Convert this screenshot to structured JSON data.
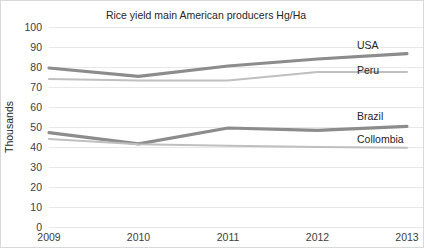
{
  "chart_data": {
    "type": "line",
    "title": "Rice yield main American producers Hg/Ha",
    "xlabel": "",
    "ylabel": "Thousands",
    "categories": [
      "2009",
      "2010",
      "2011",
      "2012",
      "2013"
    ],
    "x": [
      2009,
      2010,
      2011,
      2012,
      2013
    ],
    "ylim": [
      0,
      100
    ],
    "ytick_step": 10,
    "yticks": [
      "100",
      "90",
      "80",
      "70",
      "60",
      "50",
      "40",
      "30",
      "20",
      "10",
      "0"
    ],
    "grid": true,
    "legend_position": "right-inline-labels",
    "series": [
      {
        "name": "USA",
        "values": [
          79.5,
          75.3,
          80.5,
          84.0,
          86.7
        ],
        "color": "#8c8c8c",
        "label": "USA"
      },
      {
        "name": "Peru",
        "values": [
          74.0,
          73.2,
          73.2,
          77.5,
          77.5
        ],
        "color": "#bfbfbf",
        "label": "Peru"
      },
      {
        "name": "Brazil",
        "values": [
          47.2,
          41.6,
          49.5,
          48.3,
          50.3
        ],
        "color": "#8c8c8c",
        "label": "Brazil"
      },
      {
        "name": "Collombia",
        "values": [
          44.0,
          41.4,
          40.6,
          40.0,
          39.6
        ],
        "color": "#bfbfbf",
        "label": "Collombia"
      }
    ],
    "colors": {
      "dark_series": "#8c8c8c",
      "light_series": "#bfbfbf",
      "gridline": "#e8e8e8",
      "text": "#262626",
      "border": "#d9d9d9",
      "background": "#ffffff"
    }
  },
  "plot_geometry": {
    "plot_left": 48,
    "plot_right": 406,
    "plot_top": 26,
    "plot_bottom": 226,
    "title_x": 205,
    "title_y": 18,
    "ylabel_x": 12,
    "ylabel_y": 126,
    "xtick_y": 240,
    "series_label_x": 356,
    "series_label_y": [
      48,
      73,
      119,
      142
    ],
    "line_width_dark": 3.2,
    "line_width_light": 2.0
  }
}
